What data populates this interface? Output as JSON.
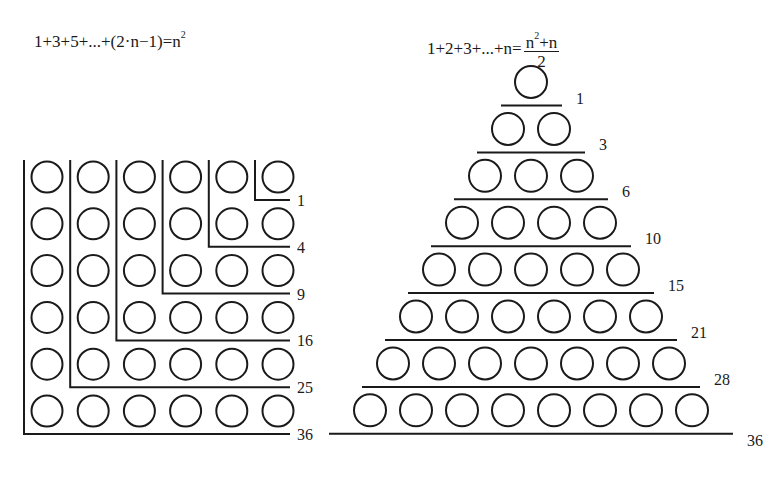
{
  "left_panel": {
    "title": "Sum of odd numbers",
    "formula": {
      "lhs": "1+3+5+...+(2·n−1)=n",
      "exponent": "2"
    },
    "grid_size": 6,
    "labels": [
      "1",
      "4",
      "9",
      "16",
      "25",
      "36"
    ]
  },
  "right_panel": {
    "title": "Sum of natural numbers",
    "formula": {
      "lhs": "1+2+3+...+n=",
      "numerator_base": "n",
      "numerator_exponent": "2",
      "numerator_rest": "+n",
      "denominator": "2"
    },
    "rows": 8,
    "labels": [
      "1",
      "3",
      "6",
      "10",
      "15",
      "21",
      "28",
      "36"
    ]
  },
  "colors": {
    "ink": "#1a1a1a",
    "background": "#ffffff"
  }
}
